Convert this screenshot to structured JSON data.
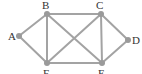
{
  "diagram": {
    "type": "graph",
    "colors": {
      "edge": "#a3a3a3",
      "node": "#9a9a9a",
      "label": "#333333"
    },
    "nodes": [
      {
        "id": "A",
        "label": "A",
        "x": 19,
        "y": 36,
        "lx": 8,
        "ly": 40
      },
      {
        "id": "B",
        "label": "B",
        "x": 47,
        "y": 14,
        "lx": 42,
        "ly": 9
      },
      {
        "id": "C",
        "label": "C",
        "x": 101,
        "y": 14,
        "lx": 96,
        "ly": 9
      },
      {
        "id": "D",
        "label": "D",
        "x": 128,
        "y": 40,
        "lx": 132,
        "ly": 44
      },
      {
        "id": "E",
        "label": "E",
        "x": 102,
        "y": 63,
        "lx": 98,
        "ly": 77
      },
      {
        "id": "F",
        "label": "F",
        "x": 47,
        "y": 63,
        "lx": 43,
        "ly": 77
      }
    ],
    "edges": [
      [
        "A",
        "B"
      ],
      [
        "A",
        "F"
      ],
      [
        "B",
        "C"
      ],
      [
        "B",
        "F"
      ],
      [
        "B",
        "E"
      ],
      [
        "C",
        "F"
      ],
      [
        "C",
        "E"
      ],
      [
        "C",
        "D"
      ],
      [
        "D",
        "E"
      ],
      [
        "F",
        "E"
      ]
    ]
  }
}
